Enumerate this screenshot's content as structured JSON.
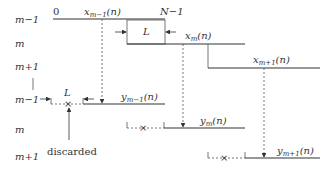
{
  "diagram": {
    "row_labels_top": [
      "m−1",
      "m",
      "m+1"
    ],
    "row_labels_bottom": [
      "m−1",
      "m",
      "m+1"
    ],
    "axis": {
      "start": "0",
      "end": "N−1"
    },
    "window_length_label": "L",
    "inputs": [
      {
        "base": "x",
        "sub": "m−1",
        "arg": "(n)"
      },
      {
        "base": "x",
        "sub": "m",
        "arg": "(n)"
      },
      {
        "base": "x",
        "sub": "m+1",
        "arg": "(n)"
      }
    ],
    "outputs": [
      {
        "base": "y",
        "sub": "m−1",
        "arg": "(n)"
      },
      {
        "base": "y",
        "sub": "m",
        "arg": "(n)"
      },
      {
        "base": "y",
        "sub": "m+1",
        "arg": "(n)"
      }
    ],
    "discarded_label": "discarded",
    "colors": {
      "line": "#333333",
      "dashed": "#555555"
    }
  }
}
